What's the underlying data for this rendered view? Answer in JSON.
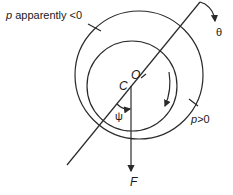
{
  "diagram": {
    "title": "",
    "labels": {
      "p_negative": "p apparently <0",
      "p_negative_var": "p",
      "p_negative_rest": " apparently <0",
      "p_positive": "p >0",
      "p_positive_var": "p",
      "p_positive_rest": ">0",
      "theta": "θ",
      "point_O": "O",
      "point_C": "C",
      "psi": "ψ",
      "force": "F"
    },
    "elements": {
      "outer_circle": {
        "cx": 139,
        "cy": 75,
        "r": 64
      },
      "inner_circle": {
        "cx": 132,
        "cy": 86,
        "r": 45
      },
      "center_line": {
        "from": [
          67,
          165
        ],
        "to": [
          200,
          2
        ]
      },
      "force_arrow": {
        "from": [
          131,
          86
        ],
        "to": [
          131,
          172
        ]
      }
    },
    "colors": {
      "stroke": "#2a2a2a",
      "text": "#1a1a1a",
      "background": "#ffffff"
    }
  }
}
